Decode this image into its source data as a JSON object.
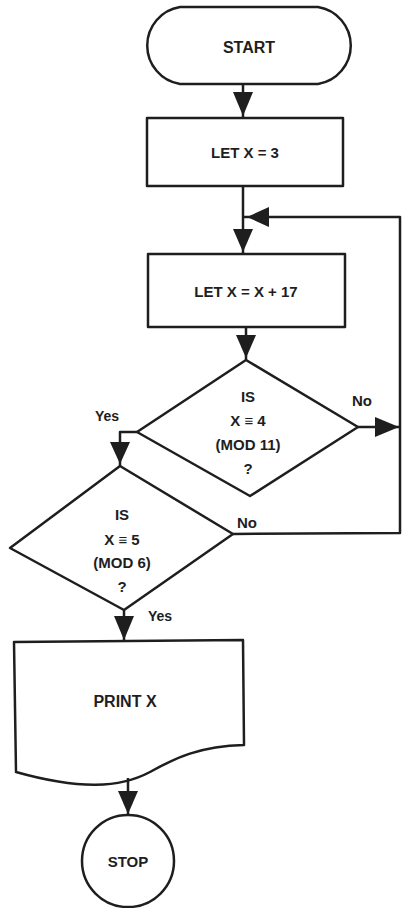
{
  "diagram": {
    "type": "flowchart",
    "colors": {
      "stroke": "#1e1e1e",
      "background": "#ffffff"
    },
    "nodes": {
      "start": {
        "shape": "terminator",
        "label": "START"
      },
      "init": {
        "shape": "process",
        "label": "LET X = 3"
      },
      "increment": {
        "shape": "process",
        "label": "LET X = X + 17"
      },
      "check1": {
        "shape": "decision",
        "lines": [
          "IS",
          "X ≡ 4",
          "(MOD 11)",
          "?"
        ]
      },
      "check2": {
        "shape": "decision",
        "lines": [
          "IS",
          "X ≡ 5",
          "(MOD 6)",
          "?"
        ]
      },
      "print": {
        "shape": "document",
        "label": "PRINT X"
      },
      "stop": {
        "shape": "connector-circle",
        "label": "STOP"
      }
    },
    "edge_labels": {
      "check1_yes": "Yes",
      "check1_no": "No",
      "check2_yes": "Yes",
      "check2_no": "No"
    },
    "edges": [
      {
        "from": "start",
        "to": "init"
      },
      {
        "from": "init",
        "to": "increment"
      },
      {
        "from": "increment",
        "to": "check1"
      },
      {
        "from": "check1",
        "to": "check2",
        "label": "Yes"
      },
      {
        "from": "check1",
        "to": "increment",
        "label": "No"
      },
      {
        "from": "check2",
        "to": "print",
        "label": "Yes"
      },
      {
        "from": "check2",
        "to": "increment",
        "label": "No"
      },
      {
        "from": "print",
        "to": "stop"
      }
    ]
  }
}
